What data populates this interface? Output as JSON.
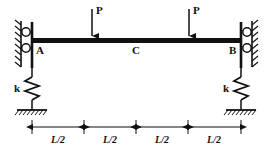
{
  "figure": {
    "type": "beam-free-body-diagram",
    "stroke_color": "#111111",
    "background_color": "#ffffff"
  },
  "beam": {
    "label_left": "A",
    "label_mid": "C",
    "label_right": "B"
  },
  "loads": [
    {
      "label": "P",
      "position": "quarter-span-left"
    },
    {
      "label": "P",
      "position": "quarter-span-right"
    }
  ],
  "springs": [
    {
      "label": "k",
      "side": "left"
    },
    {
      "label": "k",
      "side": "right"
    }
  ],
  "dimensions": [
    {
      "label": "L/2"
    },
    {
      "label": "L/2"
    },
    {
      "label": "L/2"
    },
    {
      "label": "L/2"
    }
  ],
  "supports": [
    {
      "name": "roller-support-left",
      "rollers": 2
    },
    {
      "name": "roller-support-right",
      "rollers": 2
    }
  ]
}
